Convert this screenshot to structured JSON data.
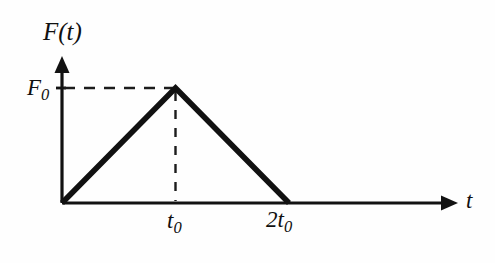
{
  "figure": {
    "kind": "line-diagram",
    "background_color": "#fefefe",
    "ink_color": "#111111",
    "axes": {
      "vertical_axis_label": "F(t)",
      "horizontal_axis_label": "t",
      "origin_label": ""
    },
    "labels": {
      "y_value_label_main": "F",
      "y_value_label_sub": "0",
      "x_tick_1_main": "t",
      "x_tick_1_sub": "0",
      "x_tick_2_main": "2t",
      "x_tick_2_sub": "0",
      "x_axis_name": "t",
      "y_axis_name_main": "F",
      "y_axis_name_paren": "(t)"
    }
  },
  "chart_data": {
    "type": "line",
    "title": "",
    "subtitle": "",
    "xlabel": "t",
    "ylabel": "F(t)",
    "x": [
      0,
      1,
      2
    ],
    "y": [
      0,
      1,
      0
    ],
    "x_tick_labels": [
      "t₀",
      "2t₀"
    ],
    "x_tick_values": [
      1,
      2
    ],
    "y_tick_labels": [
      "F₀"
    ],
    "y_tick_values": [
      1
    ],
    "xlim": [
      0,
      3.45
    ],
    "ylim": [
      0,
      1.26
    ],
    "grid": false,
    "legend": null,
    "series": [
      {
        "name": "F(t)",
        "values": [
          0,
          1,
          0
        ],
        "x": [
          0,
          1,
          2
        ],
        "style": "solid",
        "linewidth_px": 5.6,
        "color": "#111111"
      }
    ],
    "annotations": [
      {
        "name": "peak-horizontal-guide",
        "style": "dashed",
        "from": [
          0,
          1
        ],
        "to": [
          1,
          1
        ]
      },
      {
        "name": "peak-vertical-guide",
        "style": "dashed",
        "from": [
          1,
          1
        ],
        "to": [
          1,
          0
        ]
      }
    ]
  }
}
